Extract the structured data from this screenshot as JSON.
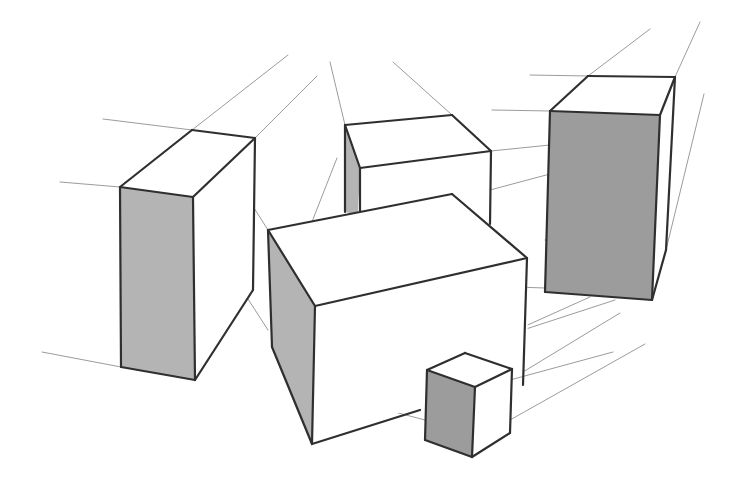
{
  "title": "Two-point perspective sketch of boxes",
  "colors": {
    "background": "#ffffff",
    "edge": "#2f2f2f",
    "guide": "#7a7a7a",
    "shade_face": "#b4b4b4",
    "dark_face": "#9c9c9c"
  },
  "boxes": [
    {
      "name": "left-tall-box",
      "faces": [
        {
          "shade": "light",
          "points": [
            [
              120,
              187
            ],
            [
              193,
              197
            ],
            [
              255,
              138
            ],
            [
              192,
              130
            ]
          ]
        },
        {
          "shade": "shade",
          "points": [
            [
              120,
              187
            ],
            [
              193,
              197
            ],
            [
              195,
              380
            ],
            [
              121,
              367
            ]
          ]
        },
        {
          "shade": "light",
          "points": [
            [
              193,
              197
            ],
            [
              255,
              138
            ],
            [
              253,
              290
            ],
            [
              195,
              380
            ]
          ]
        }
      ],
      "edges": [
        [
          [
            120,
            187
          ],
          [
            193,
            197
          ]
        ],
        [
          [
            193,
            197
          ],
          [
            255,
            138
          ]
        ],
        [
          [
            255,
            138
          ],
          [
            192,
            130
          ]
        ],
        [
          [
            192,
            130
          ],
          [
            120,
            187
          ]
        ],
        [
          [
            120,
            187
          ],
          [
            121,
            367
          ]
        ],
        [
          [
            193,
            197
          ],
          [
            195,
            380
          ]
        ],
        [
          [
            255,
            138
          ],
          [
            253,
            290
          ]
        ],
        [
          [
            121,
            367
          ],
          [
            195,
            380
          ]
        ],
        [
          [
            195,
            380
          ],
          [
            253,
            290
          ]
        ]
      ]
    },
    {
      "name": "back-middle-box",
      "faces": [
        {
          "shade": "light",
          "points": [
            [
              345,
              125
            ],
            [
              452,
              115
            ],
            [
              491,
              151
            ],
            [
              360,
              168
            ]
          ]
        },
        {
          "shade": "shade",
          "points": [
            [
              345,
              125
            ],
            [
              360,
              168
            ],
            [
              358,
              215
            ],
            [
              345,
              212
            ]
          ]
        },
        {
          "shade": "light",
          "points": [
            [
              360,
              168
            ],
            [
              491,
              151
            ],
            [
              490,
              224
            ],
            [
              358,
              215
            ]
          ]
        }
      ],
      "edges": [
        [
          [
            345,
            125
          ],
          [
            452,
            115
          ]
        ],
        [
          [
            452,
            115
          ],
          [
            491,
            151
          ]
        ],
        [
          [
            491,
            151
          ],
          [
            360,
            168
          ]
        ],
        [
          [
            360,
            168
          ],
          [
            345,
            125
          ]
        ],
        [
          [
            345,
            125
          ],
          [
            345,
            212
          ]
        ],
        [
          [
            360,
            168
          ],
          [
            360,
            215
          ]
        ],
        [
          [
            491,
            151
          ],
          [
            490,
            224
          ]
        ]
      ]
    },
    {
      "name": "right-tall-box",
      "faces": [
        {
          "shade": "light",
          "points": [
            [
              550,
              111
            ],
            [
              588,
              76
            ],
            [
              675,
              77
            ],
            [
              660,
              115
            ]
          ]
        },
        {
          "shade": "dark",
          "points": [
            [
              550,
              111
            ],
            [
              660,
              115
            ],
            [
              652,
              300
            ],
            [
              545,
              292
            ]
          ]
        },
        {
          "shade": "light",
          "points": [
            [
              660,
              115
            ],
            [
              675,
              77
            ],
            [
              666,
              250
            ],
            [
              652,
              300
            ]
          ]
        }
      ],
      "edges": [
        [
          [
            550,
            111
          ],
          [
            588,
            76
          ]
        ],
        [
          [
            588,
            76
          ],
          [
            675,
            77
          ]
        ],
        [
          [
            675,
            77
          ],
          [
            660,
            115
          ]
        ],
        [
          [
            660,
            115
          ],
          [
            550,
            111
          ]
        ],
        [
          [
            550,
            111
          ],
          [
            545,
            292
          ]
        ],
        [
          [
            660,
            115
          ],
          [
            652,
            300
          ]
        ],
        [
          [
            675,
            77
          ],
          [
            666,
            250
          ]
        ],
        [
          [
            545,
            292
          ],
          [
            652,
            300
          ]
        ],
        [
          [
            652,
            300
          ],
          [
            666,
            250
          ]
        ]
      ]
    },
    {
      "name": "front-wide-box",
      "faces": [
        {
          "shade": "light",
          "points": [
            [
              268,
              230
            ],
            [
              452,
              194
            ],
            [
              527,
              258
            ],
            [
              315,
              306
            ]
          ]
        },
        {
          "shade": "shade",
          "points": [
            [
              268,
              230
            ],
            [
              315,
              306
            ],
            [
              312,
              444
            ],
            [
              272,
              347
            ]
          ]
        },
        {
          "shade": "light",
          "points": [
            [
              315,
              306
            ],
            [
              527,
              258
            ],
            [
              528,
              367
            ],
            [
              420,
              405
            ],
            [
              312,
              444
            ]
          ]
        }
      ],
      "edges": [
        [
          [
            268,
            230
          ],
          [
            452,
            194
          ]
        ],
        [
          [
            452,
            194
          ],
          [
            527,
            258
          ]
        ],
        [
          [
            527,
            258
          ],
          [
            315,
            306
          ]
        ],
        [
          [
            315,
            306
          ],
          [
            268,
            230
          ]
        ],
        [
          [
            268,
            230
          ],
          [
            272,
            347
          ]
        ],
        [
          [
            315,
            306
          ],
          [
            312,
            444
          ]
        ],
        [
          [
            272,
            347
          ],
          [
            312,
            444
          ]
        ],
        [
          [
            527,
            258
          ],
          [
            523,
            385
          ]
        ],
        [
          [
            312,
            444
          ],
          [
            420,
            410
          ]
        ]
      ]
    },
    {
      "name": "small-cube",
      "faces": [
        {
          "shade": "light",
          "points": [
            [
              427,
              370
            ],
            [
              465,
              353
            ],
            [
              512,
              369
            ],
            [
              475,
              387
            ]
          ]
        },
        {
          "shade": "dark",
          "points": [
            [
              427,
              370
            ],
            [
              475,
              387
            ],
            [
              472,
              457
            ],
            [
              425,
              440
            ]
          ]
        },
        {
          "shade": "light",
          "points": [
            [
              475,
              387
            ],
            [
              512,
              369
            ],
            [
              510,
              433
            ],
            [
              472,
              457
            ]
          ]
        }
      ],
      "edges": [
        [
          [
            427,
            370
          ],
          [
            465,
            353
          ]
        ],
        [
          [
            465,
            353
          ],
          [
            512,
            369
          ]
        ],
        [
          [
            512,
            369
          ],
          [
            475,
            387
          ]
        ],
        [
          [
            475,
            387
          ],
          [
            427,
            370
          ]
        ],
        [
          [
            427,
            370
          ],
          [
            425,
            440
          ]
        ],
        [
          [
            475,
            387
          ],
          [
            472,
            457
          ]
        ],
        [
          [
            512,
            369
          ],
          [
            510,
            433
          ]
        ],
        [
          [
            425,
            440
          ],
          [
            472,
            457
          ]
        ],
        [
          [
            472,
            457
          ],
          [
            510,
            433
          ]
        ]
      ]
    }
  ],
  "guides": [
    [
      [
        192,
        130
      ],
      [
        288,
        55
      ]
    ],
    [
      [
        255,
        138
      ],
      [
        317,
        76
      ]
    ],
    [
      [
        103,
        119
      ],
      [
        192,
        130
      ]
    ],
    [
      [
        60,
        182
      ],
      [
        120,
        187
      ]
    ],
    [
      [
        42,
        352
      ],
      [
        121,
        367
      ]
    ],
    [
      [
        330,
        62
      ],
      [
        345,
        125
      ]
    ],
    [
      [
        393,
        62
      ],
      [
        452,
        115
      ]
    ],
    [
      [
        492,
        110
      ],
      [
        550,
        111
      ]
    ],
    [
      [
        530,
        75
      ],
      [
        588,
        76
      ]
    ],
    [
      [
        588,
        76
      ],
      [
        650,
        29
      ]
    ],
    [
      [
        675,
        77
      ],
      [
        700,
        22
      ]
    ],
    [
      [
        666,
        250
      ],
      [
        704,
        94
      ]
    ],
    [
      [
        491,
        151
      ],
      [
        550,
        145
      ]
    ],
    [
      [
        490,
        190
      ],
      [
        550,
        174
      ]
    ],
    [
      [
        390,
        140
      ],
      [
        465,
        220
      ]
    ],
    [
      [
        235,
        178
      ],
      [
        268,
        230
      ]
    ],
    [
      [
        297,
        260
      ],
      [
        337,
        158
      ]
    ],
    [
      [
        226,
        265
      ],
      [
        268,
        330
      ]
    ],
    [
      [
        545,
        240
      ],
      [
        610,
        236
      ]
    ],
    [
      [
        515,
        287
      ],
      [
        545,
        288
      ]
    ],
    [
      [
        523,
        330
      ],
      [
        615,
        300
      ]
    ],
    [
      [
        523,
        372
      ],
      [
        620,
        313
      ]
    ],
    [
      [
        510,
        380
      ],
      [
        613,
        352
      ]
    ],
    [
      [
        510,
        420
      ],
      [
        645,
        344
      ]
    ],
    [
      [
        322,
        340
      ],
      [
        430,
        370
      ]
    ],
    [
      [
        330,
        395
      ],
      [
        425,
        420
      ]
    ],
    [
      [
        359,
        315
      ],
      [
        465,
        353
      ]
    ],
    [
      [
        472,
        350
      ],
      [
        590,
        297
      ]
    ]
  ]
}
